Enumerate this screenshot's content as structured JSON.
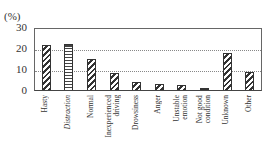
{
  "chart_data": {
    "type": "bar",
    "title": "",
    "ylabel": "(%)",
    "xlabel": "",
    "ylim": [
      0,
      30
    ],
    "yticks": [
      0,
      10,
      20,
      30
    ],
    "grid": "horizontal dotted at 10, 20",
    "categories": [
      "Hasty",
      "Distraction",
      "Normal",
      "Inexperienced driving",
      "Drowsiness",
      "Anger",
      "Unstable emotion",
      "Not good condition",
      "Unknown",
      "Other"
    ],
    "values": [
      22,
      22.5,
      15,
      8,
      4,
      3,
      2.5,
      1,
      18,
      8.5
    ],
    "patterns": [
      "diagonal",
      "horizontal",
      "diagonal",
      "diagonal",
      "diagonal",
      "diagonal",
      "diagonal",
      "solid",
      "diagonal",
      "diagonal"
    ]
  },
  "labels": {
    "unit": "(%)",
    "y": [
      "30",
      "20",
      "10",
      "0"
    ],
    "x": [
      "Hasty",
      "Distraction",
      "Normal",
      "Inexperienced\ndriving",
      "Drowsiness",
      "Anger",
      "Unstable\nemotion",
      "Not good\ncondition",
      "Unknown",
      "Other"
    ]
  }
}
